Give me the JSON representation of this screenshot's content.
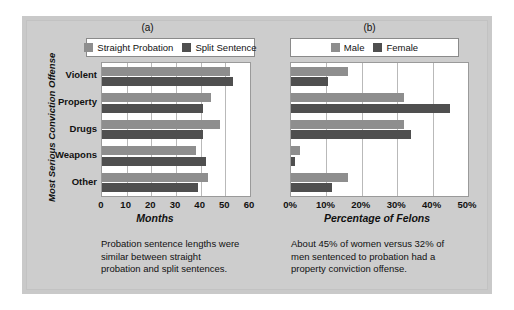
{
  "figure": {
    "background_color": "#cdcdcd",
    "panel_color": "#ffffff"
  },
  "colors": {
    "series_light": "#8e8e8e",
    "series_dark": "#4f4f4f",
    "grid": "#b9b9b9",
    "text": "#111111"
  },
  "panel_a": {
    "title": "(a)",
    "y_axis_title": "Most Serious Conviction Offense",
    "caption": "Probation sentence lengths were similar between straight probation and split sentences.",
    "legend": [
      {
        "label": "Straight Probation",
        "color": "#8e8e8e"
      },
      {
        "label": "Split Sentence",
        "color": "#4f4f4f"
      }
    ],
    "chart_data": {
      "type": "bar",
      "orientation": "horizontal",
      "title": "(a)",
      "xlabel": "Months",
      "ylabel": "Most Serious Conviction Offense",
      "categories": [
        "Violent",
        "Property",
        "Drugs",
        "Weapons",
        "Other"
      ],
      "series": [
        {
          "name": "Straight Probation",
          "values": [
            52,
            44,
            48,
            38,
            43
          ]
        },
        {
          "name": "Split Sentence",
          "values": [
            53,
            41,
            41,
            42,
            39
          ]
        }
      ],
      "xlim": [
        0,
        60
      ],
      "xticks": [
        0,
        10,
        20,
        30,
        40,
        50,
        60
      ],
      "xticklabels": [
        "0",
        "10",
        "20",
        "30",
        "40",
        "50",
        "60"
      ],
      "grid": true,
      "legend_position": "top"
    }
  },
  "panel_b": {
    "title": "(b)",
    "caption": "About 45% of women versus 32% of men sentenced to probation had a property conviction offense.",
    "legend": [
      {
        "label": "Male",
        "color": "#8e8e8e"
      },
      {
        "label": "Female",
        "color": "#4f4f4f"
      }
    ],
    "chart_data": {
      "type": "bar",
      "orientation": "horizontal",
      "title": "(b)",
      "xlabel": "Percentage of Felons",
      "ylabel": "Most Serious Conviction Offense",
      "categories": [
        "Violent",
        "Property",
        "Drugs",
        "Weapons",
        "Other"
      ],
      "series": [
        {
          "name": "Male",
          "values": [
            16,
            32,
            32,
            2.5,
            16
          ]
        },
        {
          "name": "Female",
          "values": [
            10.5,
            45,
            34,
            1,
            11.5
          ]
        }
      ],
      "xlim": [
        0,
        50
      ],
      "xticks": [
        0,
        10,
        20,
        30,
        40,
        50
      ],
      "xticklabels": [
        "0%",
        "10%",
        "20%",
        "30%",
        "40%",
        "50%"
      ],
      "grid": true,
      "legend_position": "top"
    }
  }
}
